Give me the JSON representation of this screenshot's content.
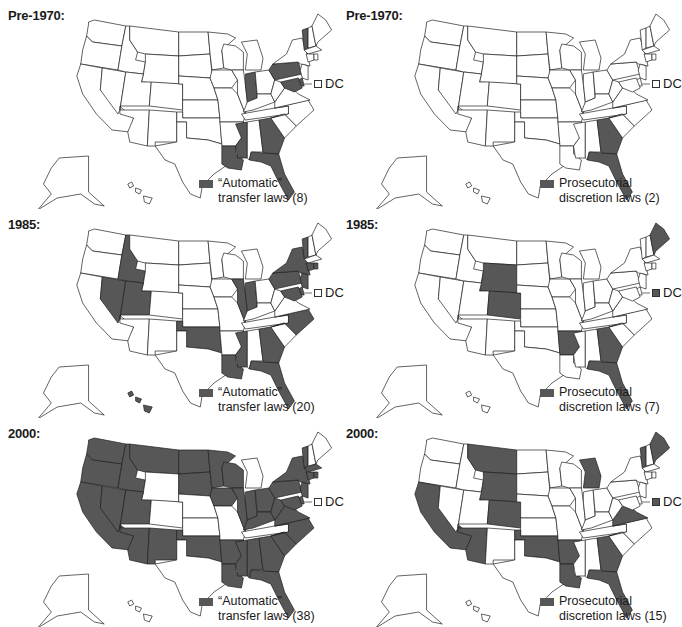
{
  "colors": {
    "filled": "#575757",
    "empty": "#ffffff",
    "stroke": "#1f1f1f"
  },
  "panels": [
    {
      "id": "auto-pre1970",
      "title": "Pre-1970:",
      "column": "automatic",
      "legend_line1": "“Automatic”",
      "legend_line2": "transfer laws (8)",
      "count": 8,
      "dc_filled": false,
      "dc_label": "DC",
      "states": [
        "VT",
        "PA",
        "MD",
        "DE",
        "IN",
        "LA",
        "MS",
        "GA",
        "FL"
      ]
    },
    {
      "id": "pros-pre1970",
      "title": "Pre-1970:",
      "column": "prosecutorial",
      "legend_line1": "Prosecutorial",
      "legend_line2": "discretion laws (2)",
      "count": 2,
      "dc_filled": false,
      "dc_label": "DC",
      "states": [
        "GA",
        "FL"
      ]
    },
    {
      "id": "auto-1985",
      "title": "1985:",
      "column": "automatic",
      "legend_line1": "“Automatic”",
      "legend_line2": "transfer laws (20)",
      "count": 20,
      "dc_filled": false,
      "dc_label": "DC",
      "states": [
        "ID",
        "NV",
        "UT",
        "OK",
        "IL",
        "IN",
        "NY",
        "VT",
        "PA",
        "NJ",
        "CT",
        "MD",
        "DE",
        "NC",
        "MS",
        "LA",
        "GA",
        "FL",
        "HI",
        "RI"
      ]
    },
    {
      "id": "pros-1985",
      "title": "1985:",
      "column": "prosecutorial",
      "legend_line1": "Prosecutorial",
      "legend_line2": "discretion laws (7)",
      "count": 7,
      "dc_filled": true,
      "dc_label": "DC",
      "states": [
        "WY",
        "CO",
        "AR",
        "GA",
        "FL",
        "ME"
      ]
    },
    {
      "id": "auto-2000",
      "title": "2000:",
      "column": "automatic",
      "legend_line1": "“Automatic”",
      "legend_line2": "transfer laws (38)",
      "count": 38,
      "dc_filled": false,
      "dc_label": "DC",
      "states": [
        "WA",
        "OR",
        "CA",
        "NV",
        "ID",
        "MT",
        "UT",
        "AZ",
        "NM",
        "ND",
        "SD",
        "MN",
        "IA",
        "WI",
        "IL",
        "IN",
        "OH",
        "KY",
        "WV",
        "VA",
        "PA",
        "NY",
        "VT",
        "MA",
        "CT",
        "RI",
        "NJ",
        "DE",
        "MD",
        "NC",
        "SC",
        "GA",
        "FL",
        "AL",
        "MS",
        "LA",
        "AR",
        "OK"
      ]
    },
    {
      "id": "pros-2000",
      "title": "2000:",
      "column": "prosecutorial",
      "legend_line1": "Prosecutorial",
      "legend_line2": "discretion laws (15)",
      "count": 15,
      "dc_filled": true,
      "dc_label": "DC",
      "states": [
        "CA",
        "AZ",
        "MT",
        "WY",
        "CO",
        "OK",
        "AR",
        "LA",
        "MI",
        "VA",
        "GA",
        "FL",
        "VT",
        "ME"
      ]
    }
  ]
}
